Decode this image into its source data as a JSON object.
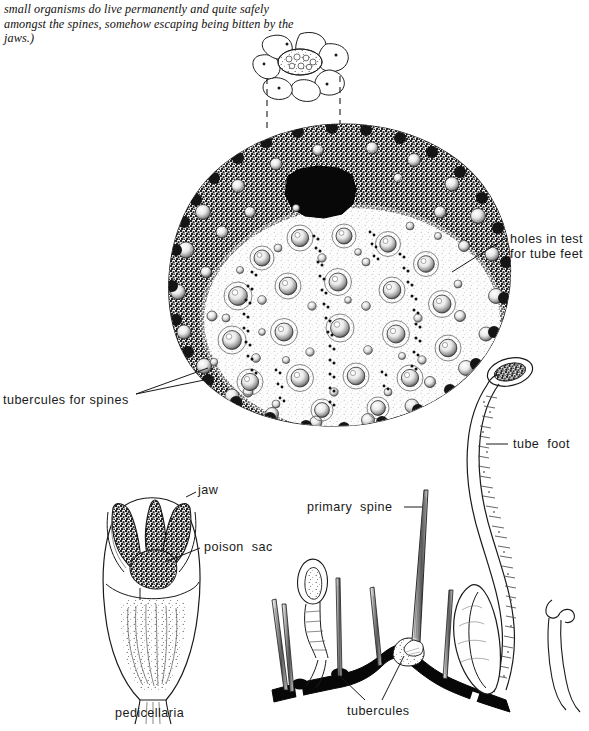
{
  "figure": {
    "background_color": "#ffffff",
    "ink_color": "#1a1a1a"
  },
  "caption": {
    "text": "small organisms do live permanently and quite safely amongst the spines, somehow escaping being bitten by the jaws.)"
  },
  "labels": {
    "holes_in_test": "holes in test\nfor tube feet",
    "tubercules_for_spines": "tubercules for spines",
    "tube_foot": "tube  foot",
    "jaw": "jaw",
    "poison_sac": "poison  sac",
    "pedicellaria": "pedicellaria",
    "primary_spine": "primary  spine",
    "tubercules": "tubercules"
  },
  "parts": {
    "apical_inset": "apical-plate-inset",
    "test": "sea-urchin-test",
    "periproct": "central-dark-opening",
    "tube_foot_drawing": "tube-foot",
    "pedicellaria_drawing": "pedicellaria",
    "spine_section_drawing": "test-wall-cross-section"
  }
}
